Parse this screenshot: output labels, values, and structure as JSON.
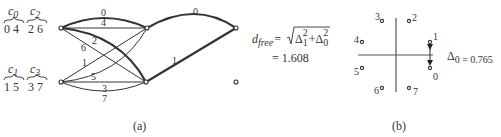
{
  "figure_a": {
    "caption": "(a)",
    "subsets": [
      {
        "name": "c",
        "sub": "0",
        "members": "0 4"
      },
      {
        "name": "c",
        "sub": "2",
        "members": "2 6"
      },
      {
        "name": "c",
        "sub": "1",
        "members": "1 5"
      },
      {
        "name": "c",
        "sub": "3",
        "members": "3 7"
      }
    ],
    "edge_labels": {
      "top_upper": "0",
      "top_lower": "4",
      "cross_2": "2",
      "cross_6": "6",
      "cross_1": "1",
      "cross_5": "5",
      "bottom_upper": "3",
      "bottom_lower": "7",
      "stage2_top": "0",
      "stage2_diag": "1"
    },
    "formula": {
      "lhs_var": "d",
      "lhs_sub": "free",
      "eq": "=",
      "delta": "Δ",
      "term1_sub": "1",
      "term1_sup": "2",
      "plus": "+",
      "term2_sub": "0",
      "term2_sup": "2",
      "result": "= 1.608"
    }
  },
  "figure_b": {
    "caption": "(b)",
    "points": [
      "0",
      "1",
      "2",
      "3",
      "4",
      "5",
      "6",
      "7"
    ],
    "delta_label": "Δ",
    "delta_sub": "0 = 0.765"
  }
}
